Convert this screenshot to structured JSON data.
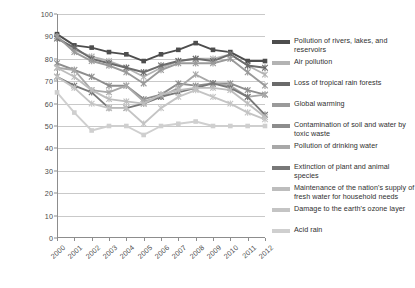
{
  "chart_data": {
    "type": "line",
    "title": "",
    "subtitle": "",
    "xlabel": "",
    "ylabel": "",
    "ylim": [
      0,
      100
    ],
    "ytick_step": 10,
    "yticks": [
      0,
      10,
      20,
      30,
      40,
      50,
      60,
      70,
      80,
      90,
      100
    ],
    "grid": true,
    "legend_position": "right",
    "categories": [
      "2000",
      "2001",
      "2002",
      "2003",
      "2004",
      "2005",
      "2006",
      "2007",
      "2008",
      "2009",
      "2010",
      "2011",
      "2012"
    ],
    "x": [
      "2000",
      "2001",
      "2002",
      "2003",
      "2004",
      "2005",
      "2006",
      "2007",
      "2008",
      "2009",
      "2010",
      "2011",
      "2012"
    ],
    "series": [
      {
        "name": "Pollution of rivers, lakes, and reservoirs",
        "color": "#4d4d4d",
        "marker": "square",
        "values": [
          91,
          86,
          85,
          83,
          82,
          79,
          82,
          84,
          87,
          84,
          83,
          79,
          79
        ]
      },
      {
        "name": "Air pollution",
        "color": "#b3b3b3",
        "marker": "star",
        "values": [
          90,
          84,
          81,
          79,
          76,
          72,
          76,
          79,
          80,
          80,
          82,
          77,
          73
        ]
      },
      {
        "name": "Loss of tropical rain forests",
        "color": "#6b6b6b",
        "marker": "star",
        "values": [
          89,
          85,
          80,
          78,
          76,
          74,
          77,
          79,
          80,
          79,
          82,
          77,
          76
        ]
      },
      {
        "name": "Global warming",
        "color": "#9a9a9a",
        "marker": "star",
        "values": [
          90,
          83,
          79,
          77,
          74,
          69,
          75,
          78,
          78,
          78,
          80,
          74,
          68
        ]
      },
      {
        "name": "Contamination of soil and water by toxic waste",
        "color": "#8d8d8d",
        "marker": "star",
        "values": [
          78,
          75,
          72,
          68,
          68,
          62,
          64,
          69,
          68,
          69,
          69,
          66,
          64
        ]
      },
      {
        "name": "Pollution of drinking water",
        "color": "#a8a8a8",
        "marker": "star",
        "values": [
          76,
          75,
          66,
          65,
          68,
          61,
          63,
          67,
          73,
          69,
          68,
          63,
          64
        ]
      },
      {
        "name": "Extinction of plant and animal species",
        "color": "#787878",
        "marker": "star",
        "values": [
          72,
          68,
          65,
          58,
          58,
          60,
          63,
          65,
          67,
          69,
          67,
          63,
          55
        ]
      },
      {
        "name": "Maintenance of the nation's supply of fresh water for household needs",
        "color": "#bdbdbd",
        "marker": "star",
        "values": [
          76,
          72,
          66,
          62,
          61,
          60,
          64,
          66,
          67,
          67,
          66,
          60,
          54
        ]
      },
      {
        "name": "Damage to the earth's ozone layer",
        "color": "#c4c4c4",
        "marker": "star",
        "values": [
          72,
          67,
          60,
          58,
          58,
          51,
          58,
          63,
          66,
          63,
          60,
          56,
          53
        ]
      },
      {
        "name": "Acid rain",
        "color": "#cfcfcf",
        "marker": "square",
        "values": [
          65,
          56,
          48,
          50,
          50,
          46,
          50,
          51,
          52,
          50,
          50,
          50,
          50
        ]
      }
    ]
  },
  "legend": {
    "items": [
      {
        "label": "Pollution of rivers, lakes, and reservoirs"
      },
      {
        "label": "Air pollution"
      },
      {
        "label": "Loss of tropical rain forests"
      },
      {
        "label": "Global warming"
      },
      {
        "label": "Contamination of soil and water by toxic waste"
      },
      {
        "label": "Pollution of drinking water"
      },
      {
        "label": "Extinction of plant and animal species"
      },
      {
        "label": "Maintenance of the nation's supply of fresh water for household needs"
      },
      {
        "label": "Damage to the earth's ozone layer"
      },
      {
        "label": "Acid rain"
      }
    ]
  }
}
